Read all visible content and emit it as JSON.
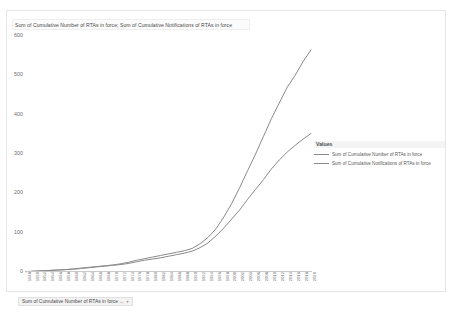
{
  "title": "Sum of Cumulative Number of RTAs in force; Sum of Cumulative Notifications of RTAs in force",
  "footer": {
    "field_chip": "Sum of Cumulative Number of RTAs in force ...",
    "chip_caret": "▾"
  },
  "legend": {
    "title": "Values",
    "items": [
      {
        "label": "Sum of Cumulative Number of RTAs in force",
        "color": "#8a8a8a"
      },
      {
        "label": "Sum of Cumulative Notifications of RTAs in force",
        "color": "#8a8a8a"
      }
    ]
  },
  "chart_data": {
    "type": "line",
    "title": "Sum of Cumulative Number of RTAs in force; Sum of Cumulative Notifications of RTAs in force",
    "xlabel": "",
    "ylabel": "",
    "ylim": [
      0,
      600
    ],
    "yticks": [
      0,
      100,
      200,
      300,
      400,
      500,
      600
    ],
    "grid": false,
    "legend_position": "right",
    "categories": [
      "1948",
      "1950",
      "1952",
      "1954",
      "1956",
      "1958",
      "1960",
      "1962",
      "1964",
      "1966",
      "1968",
      "1970",
      "1972",
      "1974",
      "1976",
      "1978",
      "1980",
      "1982",
      "1984",
      "1986",
      "1988",
      "1990",
      "1992",
      "1994",
      "1996",
      "1998",
      "2000",
      "2002",
      "2004",
      "2006",
      "2008",
      "2010",
      "2012",
      "2014",
      "2016",
      "2018",
      "2020"
    ],
    "series": [
      {
        "name": "Sum of Cumulative Notifications of RTAs in force",
        "color": "#8a8a8a",
        "values": [
          1,
          2,
          3,
          4,
          5,
          6,
          8,
          10,
          12,
          14,
          16,
          18,
          21,
          25,
          30,
          34,
          38,
          42,
          46,
          50,
          54,
          60,
          72,
          88,
          110,
          140,
          175,
          215,
          258,
          300,
          345,
          390,
          430,
          470,
          500,
          535,
          565
        ]
      },
      {
        "name": "Sum of Cumulative Number of RTAs in force",
        "color": "#8a8a8a",
        "values": [
          1,
          2,
          3,
          4,
          5,
          6,
          7,
          9,
          11,
          13,
          15,
          17,
          19,
          22,
          26,
          30,
          33,
          36,
          40,
          44,
          48,
          53,
          62,
          74,
          92,
          112,
          135,
          158,
          185,
          210,
          235,
          262,
          285,
          305,
          322,
          338,
          352
        ]
      }
    ]
  }
}
